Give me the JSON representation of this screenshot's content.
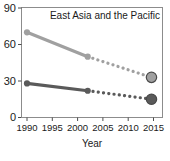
{
  "chart_data": {
    "type": "line",
    "title": "East Asia and the Pacific",
    "xlabel": "Year",
    "ylabel": "",
    "xlim": [
      1988.5,
      2016.5
    ],
    "ylim": [
      0,
      90
    ],
    "grid": false,
    "legend": "none",
    "xticks": [
      "1990",
      "1995",
      "2000",
      "2005",
      "2010",
      "2015"
    ],
    "xtick_values": [
      1990,
      1995,
      2000,
      2005,
      2010,
      2015
    ],
    "yticks": [
      "0",
      "30",
      "60",
      "90"
    ],
    "ytick_values": [
      0,
      30,
      60,
      90
    ],
    "series": [
      {
        "name": "upper-series",
        "color": "#a0a0a0",
        "solid_x": [
          1990,
          2002
        ],
        "solid_y": [
          70,
          50
        ],
        "dotted_x": [
          2002,
          2014.6
        ],
        "dotted_y": [
          50,
          33
        ],
        "markers": [
          {
            "x": 1990,
            "y": 70,
            "size": "small"
          },
          {
            "x": 2002,
            "y": 50,
            "size": "small"
          },
          {
            "x": 2014.6,
            "y": 33,
            "size": "large"
          }
        ]
      },
      {
        "name": "lower-series",
        "color": "#5a5a5a",
        "solid_x": [
          1990,
          2002
        ],
        "solid_y": [
          28,
          22
        ],
        "dotted_x": [
          2002,
          2014.6
        ],
        "dotted_y": [
          22,
          15
        ],
        "markers": [
          {
            "x": 1990,
            "y": 28,
            "size": "small"
          },
          {
            "x": 2002,
            "y": 22,
            "size": "small"
          },
          {
            "x": 2014.6,
            "y": 15,
            "size": "large"
          }
        ]
      }
    ]
  },
  "labels": {
    "title": "East Asia and the Pacific",
    "xlabel": "Year",
    "y_0": "0",
    "y_30": "30",
    "y_60": "60",
    "y_90": "90",
    "x_1990": "1990",
    "x_1995": "1995",
    "x_2000": "2000",
    "x_2005": "2005",
    "x_2010": "2010",
    "x_2015": "2015"
  }
}
